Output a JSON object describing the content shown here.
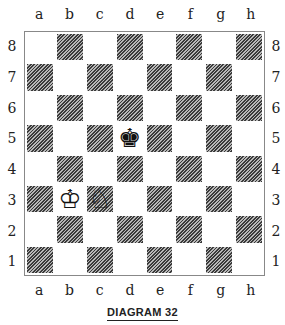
{
  "diagram": {
    "caption": "DIAGRAM 32",
    "files": [
      "a",
      "b",
      "c",
      "d",
      "e",
      "f",
      "g",
      "h"
    ],
    "ranks": [
      "8",
      "7",
      "6",
      "5",
      "4",
      "3",
      "2",
      "1"
    ],
    "pieces": [
      {
        "square": "d5",
        "piece": "king",
        "color": "black",
        "glyph": "♚"
      },
      {
        "square": "b3",
        "piece": "king",
        "color": "white",
        "glyph": "♔"
      },
      {
        "square": "c3",
        "piece": "knight",
        "color": "white",
        "glyph": "♘"
      }
    ],
    "colors": {
      "dark_square": "#3a3a3a",
      "light_square": "#ffffff",
      "border": "#888888"
    }
  }
}
